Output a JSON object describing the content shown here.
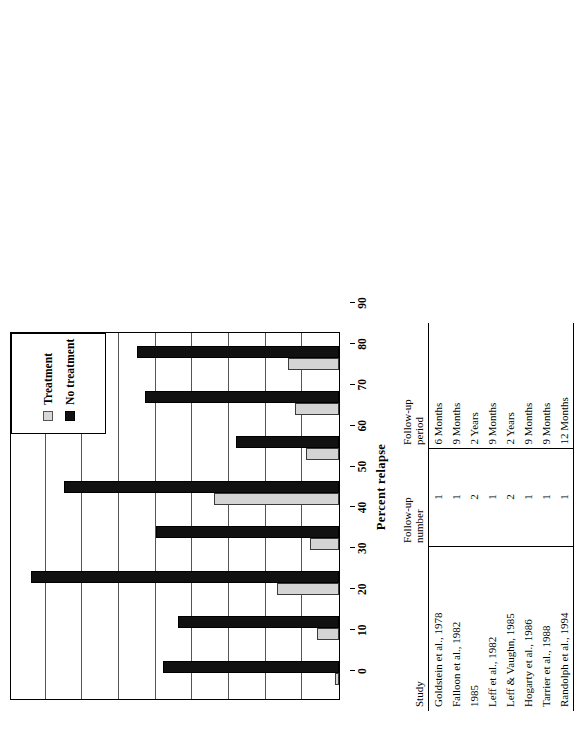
{
  "chart_data": {
    "type": "bar",
    "orientation": "vertical",
    "title": "",
    "xlabel": "",
    "ylabel": "Percent relapse",
    "ylim": [
      0,
      90
    ],
    "yticks": [
      0,
      10,
      20,
      30,
      40,
      50,
      60,
      70,
      80,
      90
    ],
    "grid": true,
    "legend_position": "top-right-inside",
    "categories": [
      "Goldstein et al., 1978",
      "Falloon et al., 1982",
      "1985",
      "Leff et al., 1982",
      "Leff & Vaughn, 1985",
      "Hogarty et al., 1986",
      "Tarrier et al., 1988",
      "Randolph et al., 1994"
    ],
    "series": [
      {
        "name": "Treatment",
        "color": "#d4d4d4",
        "values": [
          1,
          6,
          17,
          8,
          34,
          9,
          12,
          14
        ]
      },
      {
        "name": "No treatment",
        "color": "#111111",
        "values": [
          48,
          44,
          84,
          50,
          75,
          28,
          53,
          55
        ]
      }
    ]
  },
  "legend": {
    "items": [
      {
        "label": "Treatment",
        "swatch": "light-gray-square"
      },
      {
        "label": "No treatment",
        "swatch": "black-square"
      }
    ]
  },
  "axis": {
    "title": "Percent relapse",
    "tick_labels": [
      "0",
      "10",
      "20",
      "30",
      "40",
      "50",
      "60",
      "70",
      "80",
      "90"
    ]
  },
  "table": {
    "headers": {
      "study": "Study",
      "followup_number_line1": "Follow-up",
      "followup_number_line2": "number",
      "followup_period_line1": "Follow-up",
      "followup_period_line2": "period"
    },
    "rows": [
      {
        "study": "Goldstein et al., 1978",
        "number": "1",
        "period": "6 Months"
      },
      {
        "study": "Falloon et al., 1982",
        "number": "1",
        "period": "9 Months"
      },
      {
        "study": "1985",
        "number": "2",
        "period": "2 Years"
      },
      {
        "study": "Leff et al., 1982",
        "number": "1",
        "period": "9 Months"
      },
      {
        "study": "Leff & Vaughn, 1985",
        "number": "2",
        "period": "2 Years"
      },
      {
        "study": "Hogarty et al., 1986",
        "number": "1",
        "period": "9 Months"
      },
      {
        "study": "Tarrier et al., 1988",
        "number": "1",
        "period": "9 Months"
      },
      {
        "study": "Randolph et al., 1994",
        "number": "1",
        "period": "12 Months"
      }
    ]
  }
}
